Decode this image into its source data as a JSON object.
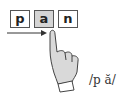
{
  "letters": [
    {
      "char": "p",
      "highlighted": false
    },
    {
      "char": "a",
      "highlighted": true
    },
    {
      "char": "n",
      "highlighted": false
    }
  ],
  "pronunciation": "/p ă/",
  "colors": {
    "highlight": "#d4d4d4",
    "border": "#555555",
    "hand_fill": "#d9d9d9"
  }
}
